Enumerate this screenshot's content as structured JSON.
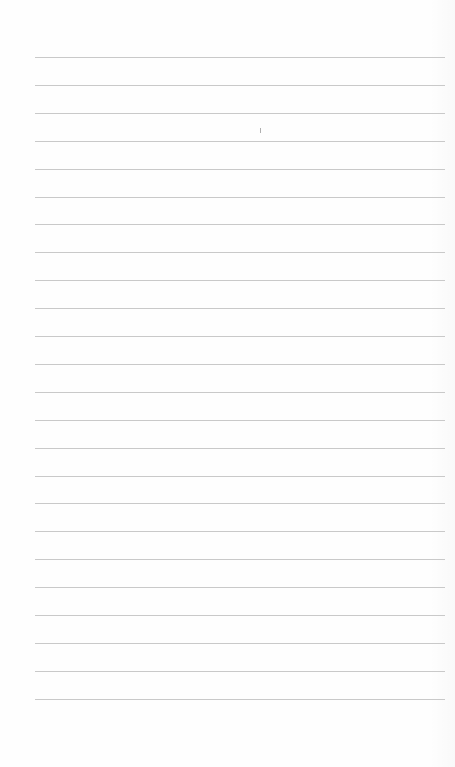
{
  "page": {
    "type": "lined-paper",
    "background": "#fefefe",
    "line_color": "#c9c9c9",
    "line_count": 24,
    "first_line_y": 57,
    "line_spacing": 27.9,
    "line_left": 35,
    "line_width": 410,
    "marks": [
      {
        "x": 260,
        "y": 128
      }
    ]
  }
}
